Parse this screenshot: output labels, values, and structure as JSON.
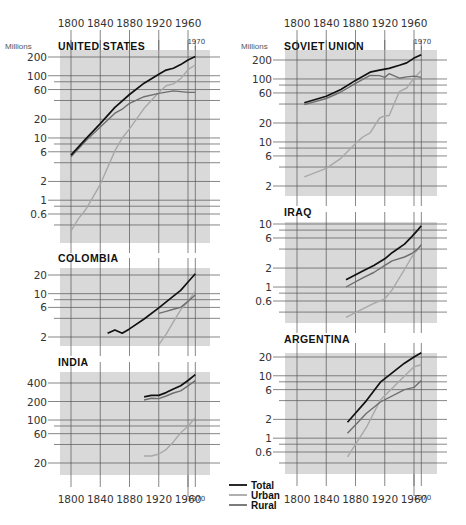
{
  "figure": {
    "unit_label": "Millions",
    "x_ticks": [
      "1800",
      "1840",
      "1880",
      "1920",
      "1960"
    ],
    "end_year_label": "1970",
    "legend": [
      {
        "label": "Total",
        "color": "#111111"
      },
      {
        "label": "Urban",
        "color": "#a8a8a8"
      },
      {
        "label": "Rural",
        "color": "#6e6e6e"
      }
    ],
    "panel_bg": "#d9d9d9",
    "grid_color": "#555555"
  },
  "chart_data": [
    {
      "type": "line",
      "title": "UNITED STATES",
      "ylabel": "Millions",
      "yscale": "log",
      "y_ticks": [
        200,
        100,
        60,
        20,
        10,
        6,
        2,
        1,
        0.6
      ],
      "ylim": [
        0.3,
        260
      ],
      "xlim": [
        1790,
        1990
      ],
      "series": [
        {
          "name": "Total",
          "x": [
            1800,
            1820,
            1840,
            1860,
            1880,
            1900,
            1920,
            1930,
            1940,
            1950,
            1960,
            1970
          ],
          "values": [
            5.3,
            9.6,
            17,
            31,
            50,
            76,
            106,
            123,
            132,
            151,
            179,
            203
          ]
        },
        {
          "name": "Urban",
          "x": [
            1800,
            1810,
            1820,
            1840,
            1860,
            1870,
            1880,
            1900,
            1920,
            1930,
            1940,
            1950,
            1960,
            1970
          ],
          "values": [
            0.32,
            0.5,
            0.7,
            1.8,
            6.2,
            10,
            14,
            30,
            54,
            69,
            74,
            90,
            125,
            149
          ]
        },
        {
          "name": "Rural",
          "x": [
            1800,
            1820,
            1840,
            1860,
            1870,
            1880,
            1900,
            1920,
            1940,
            1960,
            1970
          ],
          "values": [
            5,
            8.9,
            15,
            25,
            29,
            36,
            46,
            52,
            57,
            54,
            54
          ]
        }
      ]
    },
    {
      "type": "line",
      "title": "COLOMBIA",
      "ylabel": "Millions",
      "yscale": "log",
      "y_ticks": [
        20,
        10,
        6,
        2
      ],
      "ylim": [
        1.4,
        25
      ],
      "xlim": [
        1790,
        1990
      ],
      "series": [
        {
          "name": "Total",
          "x": [
            1850,
            1860,
            1870,
            1880,
            1900,
            1920,
            1940,
            1950,
            1960,
            1970
          ],
          "values": [
            2.3,
            2.6,
            2.3,
            2.7,
            3.9,
            5.9,
            9.1,
            11.3,
            15.4,
            21
          ]
        },
        {
          "name": "Urban",
          "x": [
            1920,
            1930,
            1940,
            1950,
            1960,
            1970
          ],
          "values": [
            1.5,
            2.2,
            3.5,
            5.5,
            7.5,
            11
          ]
        },
        {
          "name": "Rural",
          "x": [
            1920,
            1930,
            1940,
            1950,
            1960,
            1970
          ],
          "values": [
            4.8,
            5.2,
            5.6,
            6.0,
            7.5,
            9.5
          ]
        }
      ]
    },
    {
      "type": "line",
      "title": "INDIA",
      "ylabel": "Millions",
      "yscale": "log",
      "y_ticks": [
        400,
        200,
        100,
        60,
        20
      ],
      "ylim": [
        15,
        560
      ],
      "xlim": [
        1790,
        1990
      ],
      "series": [
        {
          "name": "Total",
          "x": [
            1900,
            1910,
            1920,
            1930,
            1940,
            1950,
            1960,
            1970
          ],
          "values": [
            238,
            252,
            251,
            279,
            319,
            361,
            439,
            547
          ]
        },
        {
          "name": "Urban",
          "x": [
            1900,
            1910,
            1920,
            1930,
            1940,
            1950,
            1960,
            1970
          ],
          "values": [
            26,
            26,
            28,
            33,
            44,
            62,
            79,
            109
          ]
        },
        {
          "name": "Rural",
          "x": [
            1900,
            1910,
            1920,
            1930,
            1940,
            1950,
            1960,
            1970
          ],
          "values": [
            212,
            226,
            223,
            246,
            275,
            299,
            360,
            438
          ]
        }
      ]
    },
    {
      "type": "line",
      "title": "SOVIET UNION",
      "ylabel": "Millions",
      "yscale": "log",
      "y_ticks": [
        200,
        100,
        60,
        20,
        10,
        6,
        2
      ],
      "ylim": [
        1.5,
        260
      ],
      "xlim": [
        1790,
        1990
      ],
      "series": [
        {
          "name": "Total",
          "x": [
            1810,
            1840,
            1860,
            1880,
            1900,
            1913,
            1926,
            1940,
            1950,
            1960,
            1970
          ],
          "values": [
            42,
            53,
            68,
            95,
            128,
            138,
            147,
            165,
            180,
            214,
            242
          ]
        },
        {
          "name": "Urban",
          "x": [
            1810,
            1840,
            1860,
            1880,
            1890,
            1900,
            1913,
            1920,
            1926,
            1940,
            1950,
            1960,
            1970
          ],
          "values": [
            2.8,
            3.8,
            5.5,
            9.5,
            12,
            14,
            24,
            26,
            26,
            63,
            72,
            103,
            136
          ]
        },
        {
          "name": "Rural",
          "x": [
            1810,
            1840,
            1860,
            1880,
            1900,
            1913,
            1920,
            1926,
            1940,
            1950,
            1960,
            1970
          ],
          "values": [
            39,
            49,
            62,
            85,
            114,
            113,
            106,
            121,
            103,
            108,
            111,
            106
          ]
        }
      ]
    },
    {
      "type": "line",
      "title": "IRAQ",
      "ylabel": "Millions",
      "yscale": "log",
      "y_ticks": [
        10,
        6,
        2,
        1,
        0.6
      ],
      "ylim": [
        0.3,
        12
      ],
      "xlim": [
        1790,
        1990
      ],
      "series": [
        {
          "name": "Total",
          "x": [
            1867,
            1890,
            1905,
            1920,
            1930,
            1947,
            1957,
            1965,
            1970
          ],
          "values": [
            1.3,
            1.8,
            2.2,
            2.8,
            3.5,
            4.8,
            6.3,
            8.0,
            9.4
          ]
        },
        {
          "name": "Urban",
          "x": [
            1867,
            1890,
            1905,
            1920,
            1930,
            1947,
            1957,
            1965,
            1970
          ],
          "values": [
            0.33,
            0.45,
            0.55,
            0.65,
            0.9,
            1.9,
            3.0,
            4.0,
            4.6
          ]
        },
        {
          "name": "Rural",
          "x": [
            1867,
            1890,
            1905,
            1920,
            1930,
            1947,
            1957,
            1965,
            1970
          ],
          "values": [
            1.0,
            1.4,
            1.7,
            2.2,
            2.6,
            3.0,
            3.4,
            4.0,
            4.7
          ]
        }
      ]
    },
    {
      "type": "line",
      "title": "ARGENTINA",
      "ylabel": "Millions",
      "yscale": "log",
      "y_ticks": [
        20,
        10,
        6,
        2,
        1,
        0.6
      ],
      "ylim": [
        0.3,
        30
      ],
      "xlim": [
        1790,
        1990
      ],
      "series": [
        {
          "name": "Total",
          "x": [
            1869,
            1895,
            1914,
            1947,
            1960,
            1970
          ],
          "values": [
            1.8,
            4.0,
            7.9,
            15.9,
            20.0,
            23.4
          ]
        },
        {
          "name": "Urban",
          "x": [
            1869,
            1895,
            1914,
            1947,
            1960,
            1970
          ],
          "values": [
            0.5,
            1.5,
            4.1,
            9.9,
            14.0,
            15.0
          ]
        },
        {
          "name": "Rural",
          "x": [
            1869,
            1895,
            1914,
            1947,
            1960,
            1970
          ],
          "values": [
            1.2,
            2.5,
            3.8,
            6.0,
            6.5,
            8.4
          ]
        }
      ]
    }
  ],
  "layout_panels": [
    {
      "title_key": 0,
      "col": 0,
      "box": [
        60,
        50,
        210,
        243
      ],
      "ref": [
        200,
        57,
        0.6,
        214
      ],
      "title_y": 45,
      "show_unit": true
    },
    {
      "title_key": 1,
      "col": 0,
      "box": [
        60,
        268,
        210,
        346
      ],
      "ref": [
        20,
        275,
        2,
        337
      ],
      "title_y": 262,
      "show_unit": false
    },
    {
      "title_key": 2,
      "col": 0,
      "box": [
        60,
        372,
        210,
        475
      ],
      "ref": [
        400,
        383,
        20,
        463
      ],
      "title_y": 366,
      "show_unit": false
    },
    {
      "title_key": 3,
      "col": 1,
      "box": [
        285,
        50,
        437,
        196
      ],
      "ref": [
        200,
        60,
        2,
        186
      ],
      "title_y": 45,
      "show_unit": true
    },
    {
      "title_key": 4,
      "col": 1,
      "box": [
        285,
        222,
        437,
        323
      ],
      "ref": [
        10,
        224,
        0.6,
        301
      ],
      "title_y": 216,
      "show_unit": false
    },
    {
      "title_key": 5,
      "col": 1,
      "box": [
        285,
        353,
        437,
        474
      ],
      "ref": [
        20,
        357,
        0.6,
        452
      ],
      "title_y": 343,
      "show_unit": false
    }
  ]
}
